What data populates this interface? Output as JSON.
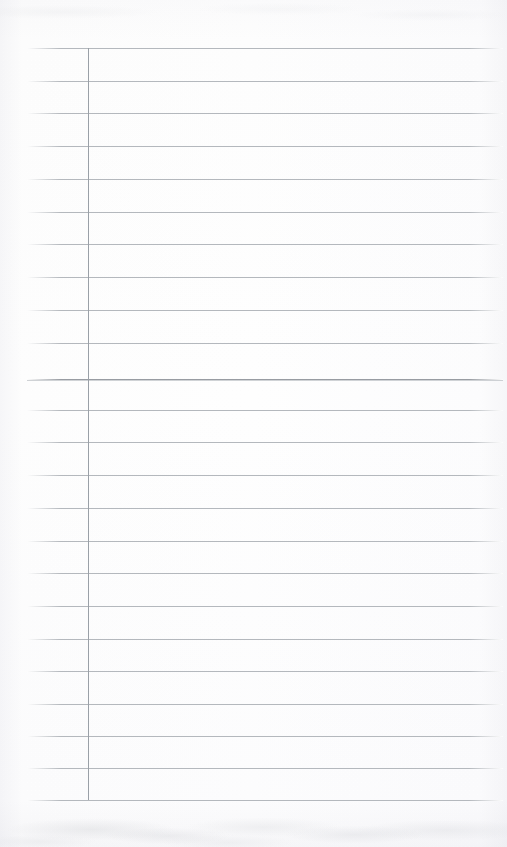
{
  "document": {
    "kind": "scanned-lined-paper",
    "title": "Blank Ruled Notebook Page",
    "page_width": 507,
    "page_height": 847,
    "orientation": "portrait",
    "content_text": "",
    "has_handwriting": false,
    "has_printed_text": false
  },
  "colors": {
    "paper_background": "#fdfdfd",
    "horizontal_rule": "#b4b8bd",
    "emphasis_rule": "#989ca2",
    "margin_rule": "#9aa0a7",
    "edge_shadow": "#f5f5f7"
  },
  "layout": {
    "top_margin_px": 48,
    "bottom_margin_px": 47,
    "rule_left_x": 27,
    "rule_right_x": 503,
    "rule_spacing_px": 32.7,
    "first_rule_y": 48,
    "last_rule_y": 800,
    "rule_count": 24
  },
  "margin_rule": {
    "label": "left margin rule",
    "x": 88,
    "y_start": 48,
    "y_end": 800,
    "width_px": 1
  },
  "rules": [
    {
      "index": 1,
      "y": 48,
      "weight": "normal"
    },
    {
      "index": 2,
      "y": 81,
      "weight": "normal"
    },
    {
      "index": 3,
      "y": 113,
      "weight": "normal"
    },
    {
      "index": 4,
      "y": 146,
      "weight": "normal"
    },
    {
      "index": 5,
      "y": 179,
      "weight": "normal"
    },
    {
      "index": 6,
      "y": 212,
      "weight": "normal"
    },
    {
      "index": 7,
      "y": 244,
      "weight": "normal"
    },
    {
      "index": 8,
      "y": 277,
      "weight": "normal"
    },
    {
      "index": 9,
      "y": 310,
      "weight": "normal"
    },
    {
      "index": 10,
      "y": 343,
      "weight": "normal"
    },
    {
      "index": 11,
      "y": 379,
      "weight": "emphasis"
    },
    {
      "index": 12,
      "y": 410,
      "weight": "normal"
    },
    {
      "index": 13,
      "y": 442,
      "weight": "normal"
    },
    {
      "index": 14,
      "y": 475,
      "weight": "normal"
    },
    {
      "index": 15,
      "y": 508,
      "weight": "normal"
    },
    {
      "index": 16,
      "y": 541,
      "weight": "normal"
    },
    {
      "index": 17,
      "y": 573,
      "weight": "normal"
    },
    {
      "index": 18,
      "y": 606,
      "weight": "normal"
    },
    {
      "index": 19,
      "y": 639,
      "weight": "normal"
    },
    {
      "index": 20,
      "y": 671,
      "weight": "normal"
    },
    {
      "index": 21,
      "y": 704,
      "weight": "normal"
    },
    {
      "index": 22,
      "y": 736,
      "weight": "normal"
    },
    {
      "index": 23,
      "y": 768,
      "weight": "normal"
    },
    {
      "index": 24,
      "y": 800,
      "weight": "normal"
    }
  ]
}
